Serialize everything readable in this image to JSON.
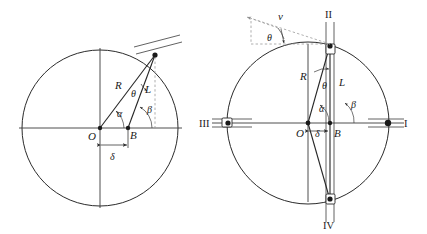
{
  "figure": {
    "background_color": "#ffffff",
    "line_color": "#2b2b2b",
    "dash_color": "#9a9a9a",
    "width": 427,
    "height": 234
  },
  "left_diagram": {
    "name": "offset-slider-crank-geometry",
    "circle": {
      "cx": 100,
      "cy": 128,
      "r": 78
    },
    "center_label": "O",
    "pin_label": "B",
    "crank_label": "R",
    "rod_label": "L",
    "crank_angle_label": "α",
    "rod_angle_label": "β",
    "transmission_angle_label": "θ",
    "offset_label": "δ",
    "labels": [
      {
        "id": "O",
        "text": "O",
        "x": 88,
        "y": 140
      },
      {
        "id": "B",
        "text": "B",
        "x": 130,
        "y": 139
      },
      {
        "id": "R",
        "text": "R",
        "x": 118,
        "y": 88
      },
      {
        "id": "L",
        "text": "L",
        "x": 146,
        "y": 92
      },
      {
        "id": "alpha",
        "text": "α",
        "x": 117,
        "y": 116
      },
      {
        "id": "beta",
        "text": "β",
        "x": 148,
        "y": 112
      },
      {
        "id": "theta",
        "text": "θ",
        "x": 132,
        "y": 96
      },
      {
        "id": "delta",
        "text": "δ",
        "x": 110,
        "y": 156
      }
    ]
  },
  "right_diagram": {
    "name": "four-position-slider-crank-mechanism",
    "circle": {
      "cx": 308,
      "cy": 123,
      "r": 81
    },
    "center_label": "O",
    "pin_label": "B",
    "crank_label": "R",
    "rod_label": "L",
    "crank_angle_label": "α",
    "rod_angle_label": "β",
    "transmission_angle_label": "θ",
    "offset_label": "δ",
    "velocity_label": "v",
    "velocity_angle_label": "θ",
    "positions": [
      {
        "id": "I",
        "text": "I",
        "x": 408,
        "y": 126,
        "location": "right"
      },
      {
        "id": "II",
        "text": "II",
        "x": 327,
        "y": 17,
        "location": "top"
      },
      {
        "id": "III",
        "text": "III",
        "x": 203,
        "y": 126,
        "location": "left"
      },
      {
        "id": "IV",
        "text": "IV",
        "x": 327,
        "y": 229,
        "location": "bottom"
      }
    ],
    "labels": [
      {
        "id": "O",
        "text": "O",
        "x": 297,
        "y": 136
      },
      {
        "id": "B",
        "text": "B",
        "x": 336,
        "y": 136
      },
      {
        "id": "R",
        "text": "R",
        "x": 305,
        "y": 77
      },
      {
        "id": "L",
        "text": "L",
        "x": 341,
        "y": 83
      },
      {
        "id": "alpha",
        "text": "α",
        "x": 320,
        "y": 111
      },
      {
        "id": "beta",
        "text": "β",
        "x": 352,
        "y": 107
      },
      {
        "id": "theta",
        "text": "θ",
        "x": 327,
        "y": 86
      },
      {
        "id": "delta",
        "text": "δ",
        "x": 320,
        "y": 136
      },
      {
        "id": "v",
        "text": "v",
        "x": 281,
        "y": 17
      },
      {
        "id": "theta_v",
        "text": "θ",
        "x": 270,
        "y": 40
      }
    ]
  }
}
